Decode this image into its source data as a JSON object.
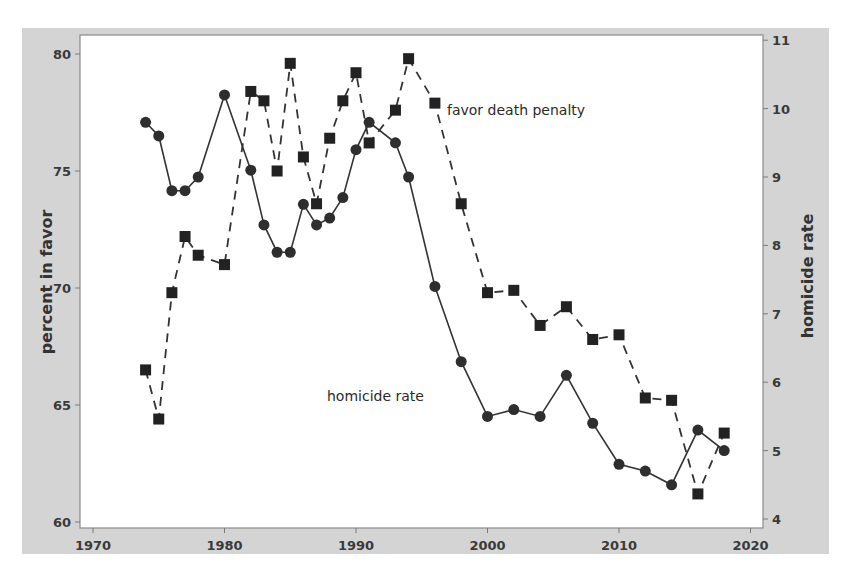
{
  "chart_data": {
    "type": "line",
    "title": "",
    "xlabel": "",
    "ylabel": "percent in favor",
    "ylabel_right": "homicide rate",
    "xlim": [
      1968.8,
      2021
    ],
    "ylim": [
      59.7,
      81.1
    ],
    "ylim_right": [
      3.85,
      11.1
    ],
    "x_ticks": [
      1970,
      1980,
      1990,
      2000,
      2010,
      2020
    ],
    "y_ticks": [
      60,
      65,
      70,
      75,
      80
    ],
    "y_ticks_right": [
      4,
      5,
      6,
      7,
      8,
      9,
      10,
      11
    ],
    "grid": false,
    "legend": "none (direct labels)",
    "annotations": [
      {
        "text": "favor death penalty",
        "x": 1996.8,
        "y": 77.5,
        "axis": "left"
      },
      {
        "text": "homicide rate",
        "x": 1986.7,
        "y": 6.0,
        "axis": "right"
      }
    ],
    "series": [
      {
        "name": "favor death penalty",
        "axis": "left",
        "style": "dashed",
        "marker": "square",
        "x": [
          1974,
          1975,
          1976,
          1977,
          1978,
          1980,
          1982,
          1983,
          1984,
          1985,
          1986,
          1987,
          1988,
          1989,
          1990,
          1991,
          1993,
          1994,
          1996,
          1998,
          2000,
          2002,
          2004,
          2006,
          2008,
          2010,
          2012,
          2014,
          2016,
          2018
        ],
        "values": [
          66.5,
          64.4,
          69.8,
          72.2,
          71.4,
          71.0,
          78.4,
          78.0,
          75.0,
          79.6,
          75.6,
          73.6,
          76.4,
          78.0,
          79.2,
          76.2,
          77.6,
          79.8,
          77.9,
          73.6,
          69.8,
          69.9,
          68.4,
          69.2,
          67.8,
          68.0,
          65.3,
          65.2,
          61.2,
          63.8
        ]
      },
      {
        "name": "homicide rate",
        "axis": "right",
        "style": "solid",
        "marker": "circle",
        "x": [
          1974,
          1975,
          1976,
          1977,
          1978,
          1980,
          1982,
          1983,
          1984,
          1985,
          1986,
          1987,
          1988,
          1989,
          1990,
          1991,
          1993,
          1994,
          1996,
          1998,
          2000,
          2002,
          2004,
          2006,
          2008,
          2010,
          2012,
          2014,
          2016,
          2018
        ],
        "values": [
          9.8,
          9.6,
          8.8,
          8.8,
          9.0,
          10.2,
          9.1,
          8.3,
          7.9,
          7.9,
          8.6,
          8.3,
          8.4,
          8.7,
          9.4,
          9.8,
          9.5,
          9.0,
          7.4,
          6.3,
          5.5,
          5.6,
          5.5,
          6.1,
          5.4,
          4.8,
          4.7,
          4.5,
          5.3,
          5.0
        ]
      }
    ]
  },
  "colors": {
    "frame": "#d4d4d4",
    "plot": "#ffffff",
    "series": "#333333",
    "text": "#333333"
  },
  "labels": {
    "x_ticks": [
      "1970",
      "1980",
      "1990",
      "2000",
      "2010",
      "2020"
    ],
    "y_ticks": [
      "60",
      "65",
      "70",
      "75",
      "80"
    ],
    "y_ticks_right": [
      "4",
      "5",
      "6",
      "7",
      "8",
      "9",
      "10",
      "11"
    ],
    "left_axis_title": "percent in favor",
    "right_axis_title": "homicide rate",
    "annotation_favor": "favor death penalty",
    "annotation_homicide": "homicide rate"
  }
}
